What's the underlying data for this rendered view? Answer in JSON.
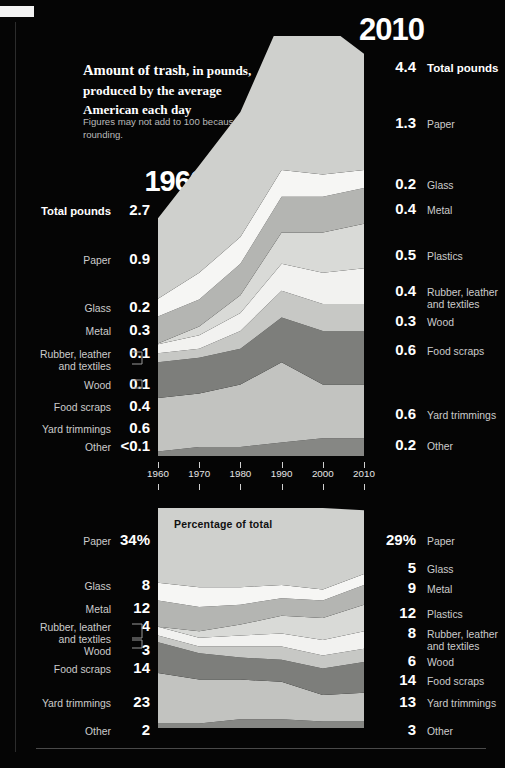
{
  "headline": {
    "lead": "Amount of trash",
    "rest": ", in pounds, produced by the average American each day",
    "note": "Figures may not add to 100 because of rounding."
  },
  "left_column": {
    "year": "1960",
    "total_label": "Total pounds",
    "total_value": "2.7",
    "rows": [
      {
        "label": "Paper",
        "value": "0.9"
      },
      {
        "label": "Glass",
        "value": "0.2"
      },
      {
        "label": "Metal",
        "value": "0.3"
      },
      {
        "label": "Rubber, leather and textiles",
        "value": "0.1"
      },
      {
        "label": "Wood",
        "value": "0.1"
      },
      {
        "label": "Food scraps",
        "value": "0.4"
      },
      {
        "label": "Yard trimmings",
        "value": "0.6"
      },
      {
        "label": "Other",
        "value": "<0.1"
      }
    ]
  },
  "right_column": {
    "year": "2010",
    "total_label": "Total pounds",
    "total_value": "4.4",
    "rows": [
      {
        "label": "Paper",
        "value": "1.3"
      },
      {
        "label": "Glass",
        "value": "0.2"
      },
      {
        "label": "Metal",
        "value": "0.4"
      },
      {
        "label": "Plastics",
        "value": "0.5"
      },
      {
        "label": "Rubber, leather and textiles",
        "value": "0.4"
      },
      {
        "label": "Wood",
        "value": "0.3"
      },
      {
        "label": "Food scraps",
        "value": "0.6"
      },
      {
        "label": "Yard trimmings",
        "value": "0.6"
      },
      {
        "label": "Other",
        "value": "0.2"
      }
    ]
  },
  "pct_left": {
    "rows": [
      {
        "label": "Paper",
        "value": "34",
        "suffix": "%"
      },
      {
        "label": "Glass",
        "value": "8",
        "suffix": ""
      },
      {
        "label": "Metal",
        "value": "12",
        "suffix": ""
      },
      {
        "label": "Rubber, leather and textiles",
        "value": "4",
        "suffix": ""
      },
      {
        "label": "Wood",
        "value": "3",
        "suffix": ""
      },
      {
        "label": "Food scraps",
        "value": "14",
        "suffix": ""
      },
      {
        "label": "Yard trimmings",
        "value": "23",
        "suffix": ""
      },
      {
        "label": "Other",
        "value": "2",
        "suffix": ""
      }
    ]
  },
  "pct_right": {
    "rows": [
      {
        "label": "Paper",
        "value": "29%"
      },
      {
        "label": "Glass",
        "value": "5"
      },
      {
        "label": "Metal",
        "value": "9"
      },
      {
        "label": "Plastics",
        "value": "12"
      },
      {
        "label": "Rubber, leather and textiles",
        "value": "8"
      },
      {
        "label": "Wood",
        "value": "6"
      },
      {
        "label": "Food scraps",
        "value": "14"
      },
      {
        "label": "Yard trimmings",
        "value": "13"
      },
      {
        "label": "Other",
        "value": "3"
      }
    ]
  },
  "axis": {
    "ticks": [
      "1960",
      "1970",
      "1980",
      "1990",
      "2000",
      "2010"
    ]
  },
  "chart_bottom_label": "Percentage of total",
  "palette": {
    "paper": "#cfd0cd",
    "glass": "#f6f6f4",
    "metal": "#b4b5b2",
    "plastics": "#d9dad7",
    "rubber": "#f2f2f0",
    "wood": "#c7c8c5",
    "food": "#7d7e7b",
    "yard": "#c2c3c0",
    "other": "#868784",
    "background": "#000000",
    "text": "#ffffff",
    "label_text": "#cccccc"
  },
  "chart_data": [
    {
      "type": "area",
      "id": "pounds-stacked-area",
      "title": "Amount of trash, in pounds, produced by the average American each day",
      "xlabel": "",
      "ylabel": "Pounds per person per day",
      "x": [
        1960,
        1970,
        1980,
        1990,
        2000,
        2010
      ],
      "xlim": [
        1960,
        2010
      ],
      "ylim": [
        0,
        4.7
      ],
      "grid": false,
      "legend": "side-labels",
      "stack_order_top_to_bottom": [
        "Paper",
        "Glass",
        "Metal",
        "Plastics",
        "Rubber, leather and textiles",
        "Wood",
        "Food scraps",
        "Yard trimmings",
        "Other"
      ],
      "series": [
        {
          "name": "Paper",
          "values": [
            0.9,
            1.2,
            1.4,
            1.7,
            1.7,
            1.3
          ]
        },
        {
          "name": "Glass",
          "values": [
            0.2,
            0.3,
            0.3,
            0.3,
            0.25,
            0.2
          ]
        },
        {
          "name": "Metal",
          "values": [
            0.3,
            0.3,
            0.35,
            0.4,
            0.4,
            0.4
          ]
        },
        {
          "name": "Plastics",
          "values": [
            0.01,
            0.1,
            0.2,
            0.35,
            0.45,
            0.5
          ]
        },
        {
          "name": "Rubber, leather and textiles",
          "values": [
            0.1,
            0.15,
            0.2,
            0.3,
            0.35,
            0.4
          ]
        },
        {
          "name": "Wood",
          "values": [
            0.1,
            0.1,
            0.2,
            0.3,
            0.3,
            0.3
          ]
        },
        {
          "name": "Food scraps",
          "values": [
            0.4,
            0.4,
            0.4,
            0.5,
            0.6,
            0.6
          ]
        },
        {
          "name": "Yard trimmings",
          "values": [
            0.6,
            0.6,
            0.7,
            0.9,
            0.6,
            0.6
          ]
        },
        {
          "name": "Other",
          "values": [
            0.05,
            0.1,
            0.1,
            0.15,
            0.2,
            0.2
          ]
        }
      ],
      "endpoints": {
        "1960": {
          "total": 2.7,
          "Paper": 0.9,
          "Glass": 0.2,
          "Metal": 0.3,
          "Rubber, leather and textiles": 0.1,
          "Wood": 0.1,
          "Food scraps": 0.4,
          "Yard trimmings": 0.6,
          "Other": 0.1
        },
        "2010": {
          "total": 4.4,
          "Paper": 1.3,
          "Glass": 0.2,
          "Metal": 0.4,
          "Plastics": 0.5,
          "Rubber, leather and textiles": 0.4,
          "Wood": 0.3,
          "Food scraps": 0.6,
          "Yard trimmings": 0.6,
          "Other": 0.2
        }
      }
    },
    {
      "type": "area",
      "id": "percentage-stacked-area",
      "title": "Percentage of total",
      "xlabel": "",
      "ylabel": "Percent of total",
      "x": [
        1960,
        1970,
        1980,
        1990,
        2000,
        2010
      ],
      "xlim": [
        1960,
        2010
      ],
      "ylim": [
        0,
        100
      ],
      "grid": false,
      "legend": "side-labels",
      "stack_order_top_to_bottom": [
        "Paper",
        "Glass",
        "Metal",
        "Plastics",
        "Rubber, leather and textiles",
        "Wood",
        "Food scraps",
        "Yard trimmings",
        "Other"
      ],
      "series": [
        {
          "name": "Paper",
          "values": [
            34,
            36,
            36,
            35,
            37,
            29
          ]
        },
        {
          "name": "Glass",
          "values": [
            8,
            9,
            8,
            6,
            5,
            5
          ]
        },
        {
          "name": "Metal",
          "values": [
            12,
            11,
            9,
            8,
            8,
            9
          ]
        },
        {
          "name": "Plastics",
          "values": [
            0,
            3,
            5,
            8,
            10,
            12
          ]
        },
        {
          "name": "Rubber, leather and textiles",
          "values": [
            4,
            4,
            5,
            6,
            7,
            8
          ]
        },
        {
          "name": "Wood",
          "values": [
            3,
            3,
            5,
            6,
            6,
            6
          ]
        },
        {
          "name": "Food scraps",
          "values": [
            14,
            12,
            10,
            10,
            12,
            14
          ]
        },
        {
          "name": "Yard trimmings",
          "values": [
            23,
            20,
            18,
            17,
            12,
            13
          ]
        },
        {
          "name": "Other",
          "values": [
            2,
            2,
            4,
            4,
            3,
            3
          ]
        }
      ],
      "endpoints": {
        "1960": {
          "Paper": 34,
          "Glass": 8,
          "Metal": 12,
          "Rubber, leather and textiles": 4,
          "Wood": 3,
          "Food scraps": 14,
          "Yard trimmings": 23,
          "Other": 2
        },
        "2010": {
          "Paper": 29,
          "Glass": 5,
          "Metal": 9,
          "Plastics": 12,
          "Rubber, leather and textiles": 8,
          "Wood": 6,
          "Food scraps": 14,
          "Yard trimmings": 13,
          "Other": 3
        }
      }
    }
  ]
}
